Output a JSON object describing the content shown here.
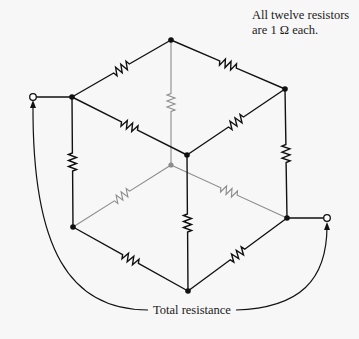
{
  "note": {
    "line1": "All twelve resistors",
    "line2": "are 1 Ω each."
  },
  "total_label": "Total resistance",
  "diagram": {
    "resistor_count": 12,
    "resistor_value": "1 Ω",
    "colors": {
      "front_wire": "#111111",
      "hidden_wire": "#8c8c8c",
      "background": "#f7f7f7"
    },
    "nodes": [
      {
        "id": "top",
        "x": 171,
        "y": 40,
        "hidden": false
      },
      {
        "id": "left-top",
        "x": 72,
        "y": 97,
        "hidden": false
      },
      {
        "id": "right-top",
        "x": 285,
        "y": 89,
        "hidden": false
      },
      {
        "id": "front",
        "x": 187,
        "y": 155,
        "hidden": false
      },
      {
        "id": "back",
        "x": 171,
        "y": 165,
        "hidden": true
      },
      {
        "id": "left-bottom",
        "x": 73,
        "y": 227,
        "hidden": false
      },
      {
        "id": "right-bottom",
        "x": 287,
        "y": 218,
        "hidden": false
      },
      {
        "id": "bottom",
        "x": 188,
        "y": 291,
        "hidden": false
      }
    ],
    "terminals": [
      {
        "id": "terminal-left",
        "x": 33,
        "y": 97,
        "connects": "left-top"
      },
      {
        "id": "terminal-right",
        "x": 327,
        "y": 218,
        "connects": "right-bottom"
      }
    ],
    "resistors": [
      {
        "from": "left-top",
        "to": "top",
        "hidden": false
      },
      {
        "from": "top",
        "to": "right-top",
        "hidden": false
      },
      {
        "from": "left-top",
        "to": "front",
        "hidden": false
      },
      {
        "from": "front",
        "to": "right-top",
        "hidden": false
      },
      {
        "from": "left-top",
        "to": "left-bottom",
        "hidden": false
      },
      {
        "from": "right-top",
        "to": "right-bottom",
        "hidden": false
      },
      {
        "from": "front",
        "to": "bottom",
        "hidden": false
      },
      {
        "from": "left-bottom",
        "to": "bottom",
        "hidden": false
      },
      {
        "from": "bottom",
        "to": "right-bottom",
        "hidden": false
      },
      {
        "from": "top",
        "to": "back",
        "hidden": true
      },
      {
        "from": "back",
        "to": "left-bottom",
        "hidden": true
      },
      {
        "from": "back",
        "to": "right-bottom",
        "hidden": true
      }
    ]
  }
}
